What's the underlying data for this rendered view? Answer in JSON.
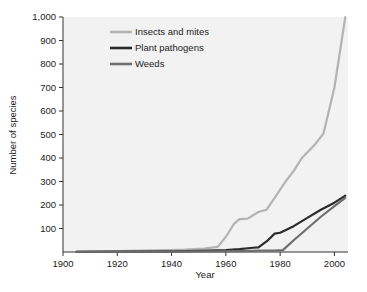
{
  "chart_data": {
    "type": "line",
    "title": "",
    "xlabel": "Year",
    "ylabel": "Number of species",
    "xlim": [
      1900,
      2005
    ],
    "ylim": [
      0,
      1000
    ],
    "grid": false,
    "legend_position": "top-left-inside",
    "xticks": [
      1900,
      1920,
      1940,
      1960,
      1980,
      2000
    ],
    "xtick_labels": [
      "1900",
      "1920",
      "1940",
      "1960",
      "1980",
      "2000"
    ],
    "yticks": [
      100,
      200,
      300,
      400,
      500,
      600,
      700,
      800,
      900,
      1000
    ],
    "ytick_labels": [
      "100",
      "200",
      "300",
      "400",
      "500",
      "600",
      "700",
      "800",
      "900",
      "1,000"
    ],
    "series": [
      {
        "name": "Insects and mites",
        "color": "#b3b3b3",
        "x": [
          1905,
          1920,
          1935,
          1945,
          1952,
          1957,
          1960,
          1963,
          1965,
          1968,
          1972,
          1975,
          1978,
          1982,
          1985,
          1988,
          1993,
          1996,
          2000,
          2004
        ],
        "values": [
          2,
          4,
          7,
          10,
          14,
          22,
          65,
          120,
          140,
          142,
          170,
          180,
          230,
          300,
          345,
          400,
          460,
          505,
          700,
          1000
        ]
      },
      {
        "name": "Plant pathogens",
        "color": "#2b2b2b",
        "x": [
          1905,
          1920,
          1940,
          1950,
          1960,
          1965,
          1970,
          1972,
          1975,
          1978,
          1980,
          1985,
          1990,
          1995,
          2000,
          2004
        ],
        "values": [
          1,
          2,
          3,
          5,
          8,
          12,
          18,
          20,
          45,
          78,
          82,
          110,
          145,
          180,
          210,
          240
        ]
      },
      {
        "name": "Weeds",
        "color": "#6e6e6e",
        "x": [
          1905,
          1920,
          1940,
          1955,
          1965,
          1970,
          1973,
          1978,
          1981,
          1985,
          1990,
          1995,
          2000,
          2004
        ],
        "values": [
          1,
          1,
          2,
          3,
          4,
          5,
          6,
          6,
          8,
          50,
          100,
          150,
          195,
          230
        ]
      }
    ]
  },
  "legend": {
    "items": [
      {
        "label": "Insects and mites",
        "color": "#b3b3b3"
      },
      {
        "label": "Plant pathogens",
        "color": "#2b2b2b"
      },
      {
        "label": "Weeds",
        "color": "#6e6e6e"
      }
    ]
  },
  "axes": {
    "x_title": "Year",
    "y_title": "Number of species"
  },
  "colors": {
    "plot_background": "#f2f2f2",
    "page_background": "#ffffff",
    "axis": "#333333",
    "text": "#1a1a1a"
  }
}
